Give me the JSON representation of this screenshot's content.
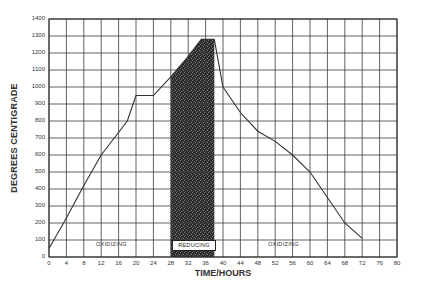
{
  "chart_data": {
    "type": "line",
    "title": "",
    "xlabel": "TIME/HOURS",
    "ylabel": "DEGREES CENTIGRADE",
    "xlim": [
      0,
      80
    ],
    "ylim": [
      0,
      1400
    ],
    "grid": true,
    "x_ticks": [
      0,
      4,
      8,
      12,
      16,
      20,
      24,
      28,
      32,
      36,
      40,
      44,
      48,
      52,
      56,
      60,
      64,
      68,
      72,
      76,
      80
    ],
    "y_ticks": [
      0,
      100,
      200,
      300,
      400,
      500,
      600,
      700,
      800,
      900,
      1000,
      1100,
      1200,
      1300,
      1400
    ],
    "series": [
      {
        "name": "Firing temperature",
        "x": [
          0,
          4,
          8,
          12,
          18,
          20,
          24,
          28,
          32,
          35,
          38,
          40,
          44,
          48,
          52,
          56,
          60,
          64,
          68,
          72
        ],
        "values": [
          50,
          230,
          420,
          600,
          800,
          950,
          950,
          1060,
          1180,
          1280,
          1280,
          1000,
          850,
          740,
          680,
          600,
          500,
          350,
          200,
          110
        ]
      }
    ],
    "regions": [
      {
        "label": "OXIDIZING",
        "x_start": 0,
        "x_end": 28,
        "style": "none"
      },
      {
        "label": "REDUCING",
        "x_start": 28,
        "x_end": 38,
        "style": "dark-shaded"
      },
      {
        "label": "OXIDIZING",
        "x_start": 38,
        "x_end": 80,
        "style": "none"
      }
    ],
    "annotations": [
      {
        "text": "OXIDIZING",
        "x": 16,
        "y": 55
      },
      {
        "text": "REDUCING",
        "x": 33,
        "y": 55
      },
      {
        "text": "OXIDIZING",
        "x": 53,
        "y": 55
      }
    ],
    "legend": "none"
  },
  "labels": {
    "ylabel": "DEGREES CENTIGRADE",
    "xlabel": "TIME/HOURS",
    "oxidizing_left": "OXIDIZING",
    "reducing": "REDUCING",
    "oxidizing_right": "OXIDIZING"
  },
  "colors": {
    "grid": "#3a3a3a",
    "line": "#333333",
    "reducing_fill": "#2a2a2a"
  }
}
